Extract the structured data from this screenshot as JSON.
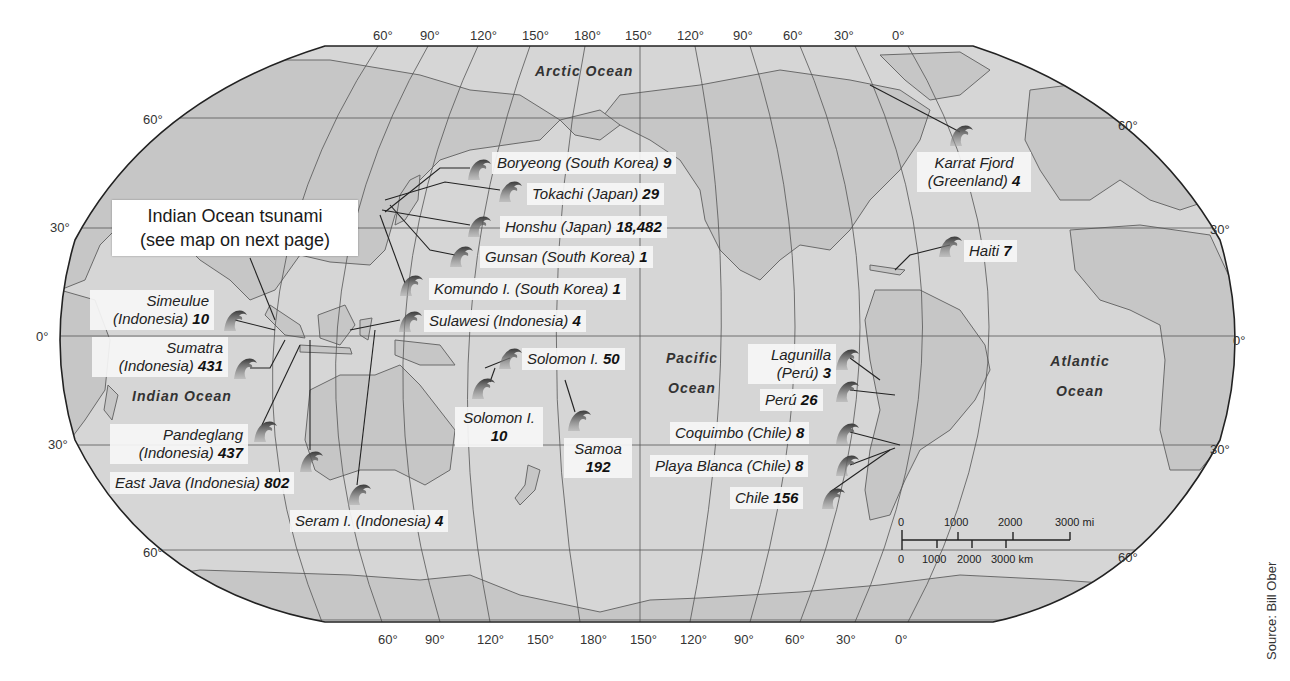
{
  "map": {
    "projection": "Robinson-like world map centered on Pacific",
    "colors": {
      "land": "#c9c9c9",
      "ocean": "#d8d8d8",
      "outline": "#222222",
      "grid": "#555555",
      "label_bg": "#f6f6f6"
    }
  },
  "graticule": {
    "top_longitudes": [
      "60°",
      "90°",
      "120°",
      "150°",
      "180°",
      "150°",
      "120°",
      "90°",
      "60°",
      "30°",
      "0°"
    ],
    "bottom_longitudes": [
      "60°",
      "90°",
      "120°",
      "150°",
      "180°",
      "150°",
      "120°",
      "90°",
      "60°",
      "30°",
      "0°"
    ],
    "left_latitudes": [
      "60°",
      "30°",
      "0°",
      "30°",
      "60°"
    ],
    "right_latitudes": [
      "60°",
      "30°",
      "0°",
      "30°",
      "60°"
    ]
  },
  "oceans": {
    "arctic": "Arctic Ocean",
    "indian": "Indian Ocean",
    "pacific_line1": "Pacific",
    "pacific_line2": "Ocean",
    "atlantic_line1": "Atlantic",
    "atlantic_line2": "Ocean"
  },
  "callout": {
    "line1": "Indian Ocean tsunami",
    "line2": "(see map on next page)"
  },
  "events": [
    {
      "name": "Boryeong (South Korea)",
      "deaths": "9"
    },
    {
      "name": "Tokachi (Japan)",
      "deaths": "29"
    },
    {
      "name": "Honshu (Japan)",
      "deaths": "18,482"
    },
    {
      "name": "Gunsan (South Korea)",
      "deaths": "1"
    },
    {
      "name": "Komundo I. (South Korea)",
      "deaths": "1"
    },
    {
      "name": "Sulawesi (Indonesia)",
      "deaths": "4"
    },
    {
      "name_line1": "Simeulue",
      "name_line2": "(Indonesia)",
      "deaths": "10"
    },
    {
      "name_line1": "Sumatra",
      "name_line2": "(Indonesia)",
      "deaths": "431"
    },
    {
      "name_line1": "Pandeglang",
      "name_line2": "(Indonesia)",
      "deaths": "437"
    },
    {
      "name": "East Java (Indonesia)",
      "deaths": "802"
    },
    {
      "name": "Seram I. (Indonesia)",
      "deaths": "4"
    },
    {
      "name": "Solomon I.",
      "deaths": "50"
    },
    {
      "name": "Solomon I.",
      "deaths": "10"
    },
    {
      "name": "Samoa",
      "deaths": "192"
    },
    {
      "name_line1": "Lagunilla",
      "name_line2": "(Perú)",
      "deaths": "3"
    },
    {
      "name": "Perú",
      "deaths": "26"
    },
    {
      "name": "Coquimbo (Chile)",
      "deaths": "8"
    },
    {
      "name": "Playa Blanca (Chile)",
      "deaths": "8"
    },
    {
      "name": "Chile",
      "deaths": "156"
    },
    {
      "name_line1": "Karrat Fjord",
      "name_line2": "(Greenland)",
      "deaths": "4"
    },
    {
      "name": "Haiti",
      "deaths": "7"
    }
  ],
  "scale_bar": {
    "miles": [
      "0",
      "1000",
      "2000",
      "3000 mi"
    ],
    "kilometers": [
      "0",
      "1000",
      "2000",
      "3000 km"
    ]
  },
  "source": "Source: Bill Ober",
  "icons": {
    "wave": "tsunami-wave-icon"
  }
}
